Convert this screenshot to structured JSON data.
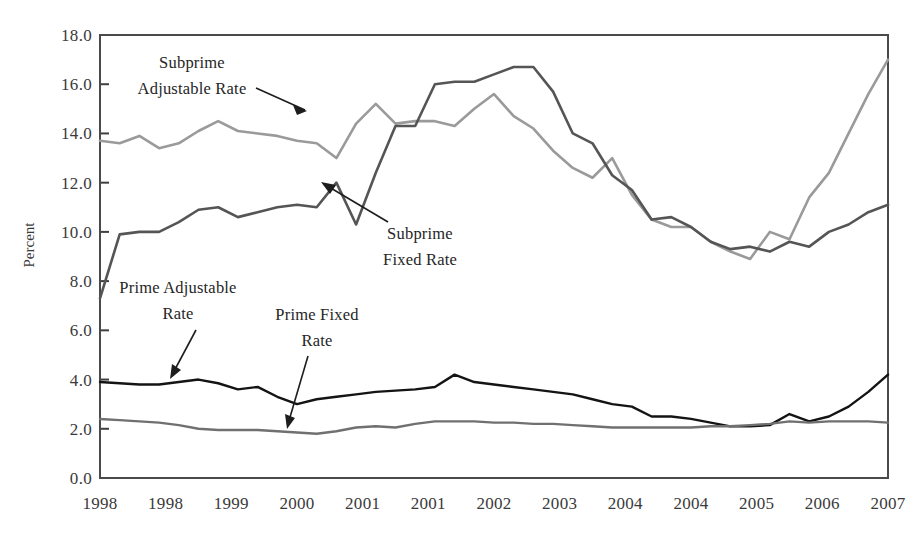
{
  "figure": {
    "background_color": "#ffffff",
    "frame_color": "#4a4a4a",
    "ylabel": "Percent"
  },
  "annotations": {
    "subprime_adjustable": {
      "line1": "Subprime",
      "line2": "Adjustable Rate"
    },
    "subprime_fixed": {
      "line1": "Subprime",
      "line2": "Fixed Rate"
    },
    "prime_adjustable": {
      "line1": "Prime Adjustable",
      "line2": "Rate"
    },
    "prime_fixed": {
      "line1": "Prime Fixed",
      "line2": "Rate"
    }
  },
  "chart_data": {
    "type": "line",
    "title": "",
    "subtitle": "",
    "xlabel": "",
    "ylabel": "Percent",
    "ylim": [
      0.0,
      18.0
    ],
    "ytick_step": 2.0,
    "yticks": [
      "0.0",
      "2.0",
      "4.0",
      "6.0",
      "8.0",
      "10.0",
      "12.0",
      "14.0",
      "16.0",
      "18.0"
    ],
    "xticks": [
      "1998",
      "1998",
      "1999",
      "2000",
      "2001",
      "2001",
      "2002",
      "2003",
      "2004",
      "2004",
      "2005",
      "2006",
      "2007"
    ],
    "xtick_positions": [
      0,
      3.3333,
      6.6667,
      10,
      13.3333,
      16.6667,
      20,
      23.3333,
      26.6667,
      30,
      33.3333,
      36.6667,
      40
    ],
    "grid": false,
    "legend_position": "inline-annotations",
    "x_index_count": 41,
    "series": [
      {
        "name": "Subprime Adjustable Rate",
        "color": "#9a9a9a",
        "width": 2.6,
        "values": [
          13.7,
          13.6,
          13.9,
          13.4,
          13.6,
          14.1,
          14.5,
          14.1,
          14.0,
          13.9,
          13.7,
          13.6,
          13.0,
          14.4,
          15.2,
          14.4,
          14.5,
          14.5,
          14.3,
          15.0,
          15.6,
          14.7,
          14.2,
          13.3,
          12.6,
          12.2,
          13.0,
          11.5,
          10.5,
          10.2,
          10.2,
          9.6,
          9.2,
          8.9,
          10.0,
          9.7,
          11.4,
          12.4,
          14.0,
          15.6,
          17.0
        ]
      },
      {
        "name": "Subprime Fixed Rate",
        "color": "#555555",
        "width": 2.6,
        "values": [
          7.3,
          9.9,
          10.0,
          10.0,
          10.4,
          10.9,
          11.0,
          10.6,
          10.8,
          11.0,
          11.1,
          11.0,
          12.0,
          10.3,
          12.4,
          14.3,
          14.3,
          16.0,
          16.1,
          16.1,
          16.4,
          16.7,
          16.7,
          15.7,
          14.0,
          13.6,
          12.3,
          11.7,
          10.5,
          10.6,
          10.2,
          9.6,
          9.3,
          9.4,
          9.2,
          9.6,
          9.4,
          10.0,
          10.3,
          10.8,
          11.1
        ]
      },
      {
        "name": "Prime Adjustable Rate",
        "color": "#141414",
        "width": 2.4,
        "values": [
          3.9,
          3.85,
          3.8,
          3.8,
          3.9,
          4.0,
          3.85,
          3.6,
          3.7,
          3.3,
          3.0,
          3.2,
          3.3,
          3.4,
          3.5,
          3.55,
          3.6,
          3.7,
          4.2,
          3.9,
          3.8,
          3.7,
          3.6,
          3.5,
          3.4,
          3.2,
          3.0,
          2.9,
          2.5,
          2.5,
          2.4,
          2.25,
          2.1,
          2.1,
          2.15,
          2.6,
          2.3,
          2.5,
          2.9,
          3.5,
          4.2
        ]
      },
      {
        "name": "Prime Fixed Rate",
        "color": "#707070",
        "width": 2.4,
        "values": [
          2.4,
          2.35,
          2.3,
          2.25,
          2.15,
          2.0,
          1.95,
          1.95,
          1.95,
          1.9,
          1.85,
          1.8,
          1.9,
          2.05,
          2.1,
          2.05,
          2.2,
          2.3,
          2.3,
          2.3,
          2.25,
          2.25,
          2.2,
          2.2,
          2.15,
          2.1,
          2.05,
          2.05,
          2.05,
          2.05,
          2.05,
          2.1,
          2.1,
          2.15,
          2.2,
          2.3,
          2.25,
          2.3,
          2.3,
          2.3,
          2.25
        ]
      }
    ]
  }
}
